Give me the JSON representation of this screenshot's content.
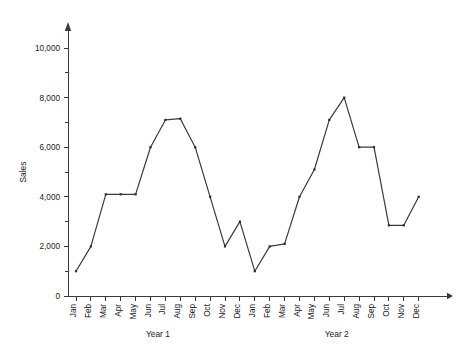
{
  "chart_data": {
    "type": "line",
    "title": "",
    "xlabel": "",
    "ylabel": "Sales",
    "ylim": [
      0,
      10000
    ],
    "ytick_step": 2000,
    "yminor_step": 1000,
    "grid": false,
    "legend": false,
    "categories": [
      "Jan",
      "Feb",
      "Mar",
      "Apr",
      "May",
      "Jun",
      "Jul",
      "Aug",
      "Sep",
      "Oct",
      "Nov",
      "Dec",
      "Jan",
      "Feb",
      "Mar",
      "Apr",
      "May",
      "Jun",
      "Jul",
      "Aug",
      "Sep",
      "Oct",
      "Nov",
      "Dec"
    ],
    "values": [
      1000,
      2000,
      4100,
      4100,
      4100,
      6000,
      7100,
      7150,
      6000,
      4000,
      2000,
      3000,
      1000,
      2000,
      2100,
      4000,
      5100,
      7100,
      8000,
      6000,
      6000,
      2850,
      2850,
      4000
    ],
    "ytick_labels": [
      "0",
      "2,000",
      "4,000",
      "6,000",
      "8,000",
      "10,000"
    ],
    "ytick_values": [
      0,
      2000,
      4000,
      6000,
      8000,
      10000
    ],
    "group_labels": [
      "Year 1",
      "Year 2"
    ],
    "groups": [
      {
        "label": "Year 1",
        "start_index": 0,
        "end_index": 11
      },
      {
        "label": "Year 2",
        "start_index": 12,
        "end_index": 23
      }
    ],
    "line_color": "#3a3a3a",
    "marker_color": "#2e2e2e",
    "axis_color": "#3a3a3a",
    "background_color": "#ffffff"
  }
}
